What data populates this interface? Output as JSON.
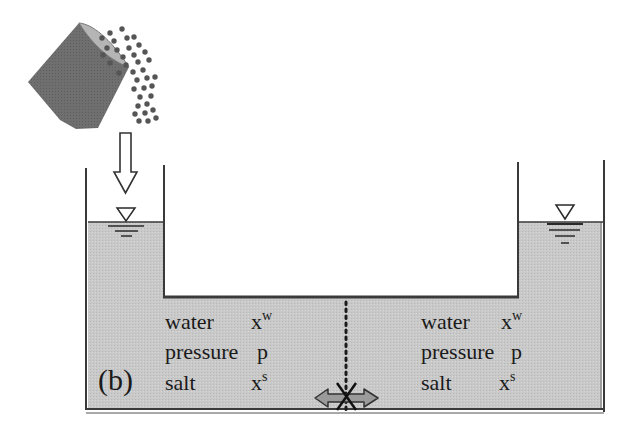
{
  "figure": {
    "panel_label": "(b)",
    "colors": {
      "water_fill": "#c8c8c8",
      "wall": "#3a3a3a",
      "bucket": "#6e6e6e",
      "bucket_rim": "#b4b4b4",
      "particle": "#555555",
      "exchange_arrow": "#999999",
      "background": "#ffffff"
    },
    "left_compartment": {
      "water": {
        "name": "water",
        "symbol": "x",
        "sup": "w"
      },
      "pressure": {
        "name": "pressure",
        "symbol": "p"
      },
      "salt": {
        "name": "salt",
        "symbol": "x",
        "sup": "s"
      }
    },
    "right_compartment": {
      "water": {
        "name": "water",
        "symbol": "x",
        "sup": "w"
      },
      "pressure": {
        "name": "pressure",
        "symbol": "p"
      },
      "salt": {
        "name": "salt",
        "symbol": "x",
        "sup": "s"
      }
    },
    "elements": {
      "bucket": "salt bucket pouring particles",
      "pour_arrow": "down-arrow",
      "left_level_marker": "water-level-triangle",
      "right_level_marker": "water-level-triangle",
      "membrane": "dotted semipermeable membrane",
      "blocked_exchange": "double-arrow crossed out (X)"
    }
  }
}
